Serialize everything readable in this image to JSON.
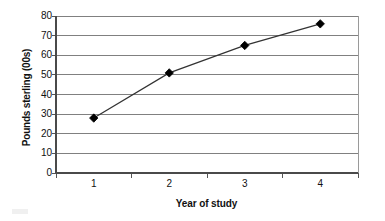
{
  "chart_data": {
    "type": "line",
    "title": "",
    "xlabel": "Year of study",
    "ylabel": "Pounds sterling (00s)",
    "categories": [
      "1",
      "2",
      "3",
      "4"
    ],
    "values": [
      28,
      51,
      65,
      76
    ],
    "series": [
      {
        "name": "Pounds sterling",
        "values": [
          28,
          51,
          65,
          76
        ],
        "marker": "diamond",
        "marker_color": "#000000",
        "line_color": "#333333"
      }
    ],
    "ylim": [
      0,
      80
    ],
    "ytick_step": 10,
    "yticks": [
      "0",
      "10",
      "20",
      "30",
      "40",
      "50",
      "60",
      "70",
      "80"
    ],
    "xticks": [
      "1",
      "2",
      "3",
      "4"
    ],
    "grid": "horizontal",
    "legend": "none",
    "plot_background": "#ffffff",
    "gridline_color": "#808080",
    "axis_color": "#555555"
  },
  "axes": {
    "y_title": "Pounds sterling (00s)",
    "x_title": "Year of study"
  }
}
